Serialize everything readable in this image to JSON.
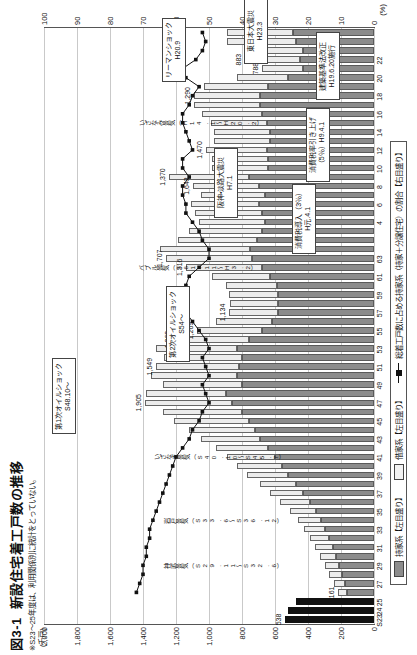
{
  "figure": {
    "number": "図3-1",
    "title": "新設住宅着工戸数の推移",
    "note": "※S23～25年度は、利用関係別に統計をとっていない。"
  },
  "axes": {
    "left_unit": "(千戸)",
    "right_unit": "(%)",
    "left_ticks": [
      "0",
      "200",
      "400",
      "600",
      "800",
      "1,000",
      "1,200",
      "1,400",
      "1,600",
      "1,800",
      "2,000"
    ],
    "right_ticks": [
      "0",
      "10",
      "20",
      "30",
      "40",
      "50",
      "60",
      "70",
      "80",
      "90",
      "100"
    ],
    "left_min": 0,
    "left_max": 2000,
    "right_min": 0,
    "right_max": 100
  },
  "legend": {
    "items": [
      {
        "key": "owner",
        "label": "持家系【左目盛り】",
        "swatch": "owner-swatch"
      },
      {
        "key": "rent",
        "label": "借家系【左目盛り】",
        "swatch": "rent-swatch"
      },
      {
        "key": "ratio",
        "label": "総着工戸数に占める持家系（持家＋分譲住宅）の割合【右目盛り】",
        "swatch": "line-marker-swatch"
      }
    ]
  },
  "callouts": [
    {
      "name": "first-oil-shock",
      "line1": "第1次オイルショック",
      "line2": "S48.10～"
    },
    {
      "name": "second-oil-shock",
      "line1": "第2次オイルショック",
      "line2": "S54～"
    },
    {
      "name": "consumption-tax-intro",
      "line1": "消費税導入（3％）",
      "line2": "H元.4.1"
    },
    {
      "name": "consumption-tax-raise",
      "line1": "消費税率引き上げ",
      "line2": "（5％）H9.4.1"
    },
    {
      "name": "building-standards-law",
      "line1": "建築基準法改正",
      "line2": "H19.6.20施行"
    },
    {
      "name": "great-hanshin-earthquake",
      "line1": "阪神・淡路大震災",
      "line2": "H7.1"
    },
    {
      "name": "great-east-japan-earthquake",
      "line1": "東日本大震災",
      "line2": "H23.3"
    },
    {
      "name": "lehman-shock",
      "line1": "リーマンショック",
      "line2": "H20.9"
    }
  ],
  "boom_labels": [
    {
      "name": "jinmu-boom",
      "text": "神武景気（S29.11～S32.6）"
    },
    {
      "name": "iwato-boom",
      "text": "岩戸景気（S33.6～S36.12）"
    },
    {
      "name": "izanagi-boom",
      "text": "いざなぎ景気（S40.10～S45.7）"
    },
    {
      "name": "bubble-boom",
      "text": "バブル景気（S61.11～H3.2）"
    },
    {
      "name": "izanami-boom",
      "text": "いざなみ景気（H14.1～H20.2）"
    }
  ],
  "chart_data": {
    "type": "bar",
    "title": "新設住宅着工戸数の推移",
    "xlabel": "年度",
    "ylabel": "千戸",
    "y2label": "%",
    "ylim": [
      0,
      2000
    ],
    "y2lim": [
      0,
      100
    ],
    "grid": true,
    "legend_position": "bottom",
    "categories": [
      "S23",
      "24",
      "25",
      "26",
      "27",
      "28",
      "29",
      "30",
      "31",
      "32",
      "33",
      "34",
      "35",
      "36",
      "37",
      "38",
      "39",
      "40",
      "41",
      "42",
      "43",
      "44",
      "45",
      "46",
      "47",
      "48",
      "49",
      "50",
      "51",
      "52",
      "53",
      "54",
      "55",
      "56",
      "57",
      "58",
      "59",
      "60",
      "61",
      "62",
      "63",
      "H元",
      "2",
      "3",
      "4",
      "5",
      "6",
      "7",
      "8",
      "9",
      "10",
      "11",
      "12",
      "13",
      "14",
      "15",
      "16",
      "17",
      "18",
      "19",
      "20",
      "21",
      "22",
      "23",
      "24",
      "25"
    ],
    "xtick_labels": [
      "S23",
      "25",
      "27",
      "29",
      "31",
      "33",
      "35",
      "37",
      "39",
      "41",
      "43",
      "45",
      "47",
      "49",
      "51",
      "53",
      "55",
      "57",
      "59",
      "61",
      "63",
      "H2",
      "4",
      "6",
      "8",
      "10",
      "12",
      "14",
      "16",
      "18",
      "20",
      "22",
      "24"
    ],
    "series": [
      {
        "name": "持家系【左目盛り】",
        "type": "bar-segment",
        "color": "#8c8c8c",
        "values": [
          538,
          520,
          470,
          161,
          175,
          195,
          210,
          230,
          250,
          270,
          295,
          320,
          350,
          390,
          430,
          470,
          520,
          560,
          600,
          640,
          690,
          720,
          760,
          800,
          860,
          900,
          800,
          830,
          820,
          800,
          830,
          760,
          680,
          620,
          580,
          580,
          580,
          590,
          630,
          680,
          740,
          750,
          710,
          680,
          660,
          680,
          700,
          660,
          700,
          760,
          640,
          640,
          650,
          630,
          630,
          650,
          680,
          690,
          690,
          640,
          520,
          430,
          450,
          430,
          470,
          490
        ]
      },
      {
        "name": "借家系【左目盛り】",
        "type": "bar-segment",
        "color": "#ececec",
        "values": [
          0,
          0,
          0,
          60,
          70,
          80,
          90,
          100,
          110,
          120,
          130,
          140,
          160,
          180,
          200,
          220,
          250,
          270,
          290,
          320,
          360,
          400,
          450,
          480,
          530,
          480,
          480,
          520,
          500,
          470,
          490,
          450,
          390,
          340,
          300,
          290,
          300,
          310,
          350,
          460,
          520,
          550,
          480,
          440,
          400,
          405,
          410,
          390,
          400,
          480,
          340,
          340,
          370,
          340,
          340,
          340,
          360,
          400,
          400,
          390,
          310,
          250,
          330,
          357,
          420,
          400
        ]
      },
      {
        "name": "総着工戸数に占める持家系（持家＋分譲住宅）の割合【右目盛り】",
        "type": "line",
        "color": "#111111",
        "axis": "right",
        "values": [
          null,
          null,
          null,
          72,
          71,
          70,
          70,
          69,
          69,
          68,
          68,
          67,
          66,
          65,
          64,
          63,
          62,
          61,
          60,
          58,
          56,
          55,
          53,
          52,
          50,
          51,
          52,
          50,
          51,
          52,
          50,
          51,
          53,
          55,
          57,
          58,
          58,
          57,
          56,
          53,
          50,
          50,
          52,
          53,
          55,
          57,
          57,
          58,
          58,
          56,
          58,
          58,
          55,
          56,
          57,
          58,
          58,
          56,
          55,
          53,
          57,
          58,
          54,
          52,
          51,
          52
        ]
      }
    ],
    "data_labels": [
      {
        "category": "S23",
        "value": 538,
        "text": "538"
      },
      {
        "category": "26",
        "value": 161,
        "text": "161"
      },
      {
        "category": "47",
        "value": 1905,
        "text": "1,905"
      },
      {
        "category": "51",
        "value": 1549,
        "text": "1,549"
      },
      {
        "category": "54",
        "value": 1269,
        "text": "1,269"
      },
      {
        "category": "55",
        "value": 1269,
        "text": "1,269"
      },
      {
        "category": "57",
        "value": 1134,
        "text": "1,134"
      },
      {
        "category": "62",
        "value": 1674,
        "text": "1,316"
      },
      {
        "category": "63",
        "value": 1707,
        "text": "1,707"
      },
      {
        "category": "H2",
        "value": 1707,
        "text": "1,707"
      },
      {
        "category": "8",
        "value": 1643,
        "text": "1,643"
      },
      {
        "category": "9",
        "value": 1387,
        "text": "1,370"
      },
      {
        "category": "12",
        "value": 1470,
        "text": "1,470"
      },
      {
        "category": "18",
        "value": 1290,
        "text": "1,290"
      },
      {
        "category": "21",
        "value": 788,
        "text": "788"
      },
      {
        "category": "22",
        "value": 883,
        "text": "883"
      }
    ]
  }
}
